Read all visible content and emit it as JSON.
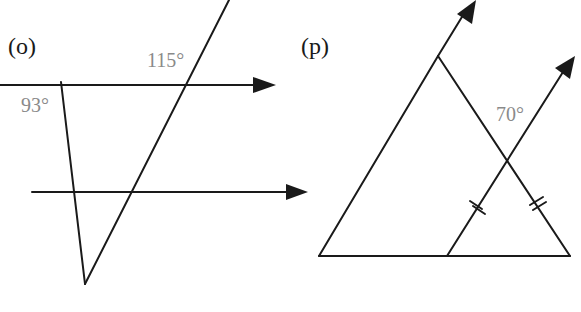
{
  "figures": [
    {
      "id": "o",
      "label": "(o)",
      "angles": [
        {
          "text": "93°",
          "x": 21,
          "y": 95
        },
        {
          "text": "115°",
          "x": 147,
          "y": 50
        }
      ],
      "description": "Two parallel arrowed lines cut by two transversals forming a V-shaped triangle"
    },
    {
      "id": "p",
      "label": "(p)",
      "angles": [
        {
          "text": "70°",
          "x": 495,
          "y": 105
        }
      ],
      "tick_marks": "double ticks marking equal segments",
      "description": "Triangle with a parallel arrowed line through the base crossing the right side"
    }
  ],
  "colors": {
    "line": "#1a1a1a",
    "angle_label": "#8a8a8a"
  }
}
